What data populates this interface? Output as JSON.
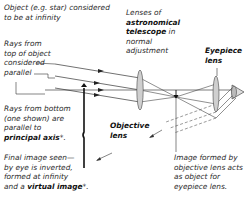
{
  "diagram": {
    "title_note": "Object (e.g. star) considered to be at infinity",
    "labels": {
      "object_line1": "Object (e.g. star) considered",
      "object_line2": "to be at infinity",
      "rays_top_line1": "Rays from",
      "rays_top_line2": "top of object",
      "rays_top_line3": "considered",
      "rays_top_line4": "parallel",
      "rays_bottom_line1": "Rays from bottom",
      "rays_bottom_line2": "(one shown) are",
      "rays_bottom_line3": "parallel to",
      "rays_bottom_bold": "principal axis",
      "rays_bottom_suffix": "*.",
      "final_line1": "Final image seen—",
      "final_line2": "by eye is inverted,",
      "final_line3": "formed at infinity",
      "final_line4_prefix": "and a ",
      "final_line4_bold": "virtual image",
      "final_line4_suffix": "*.",
      "lenses_line1": "Lenses of",
      "lenses_bold1": "astronomical",
      "lenses_bold2": "telescope",
      "lenses_line3_suffix": " in",
      "lenses_line4": "normal",
      "lenses_line5": "adjustment",
      "eyepiece_line1": "Eyepiece",
      "eyepiece_line2": "lens",
      "objective_line1": "Objective",
      "objective_line2": "lens",
      "image_line1": "Image formed by",
      "image_line2": "objective lens acts",
      "image_line3": "as object for",
      "image_line4": "eyepiece lens."
    },
    "elements": [
      "objective-lens",
      "eyepiece-lens",
      "intermediate-inverted-image",
      "eye",
      "principal-axis",
      "parallel-rays"
    ],
    "colors": {
      "lens_fill": "#c8c8c8",
      "line": "#333333",
      "text": "#2a2a2a"
    }
  }
}
